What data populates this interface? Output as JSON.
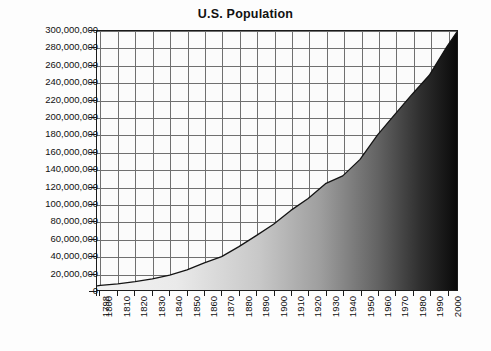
{
  "chart_data": {
    "type": "area",
    "title": "U.S. Population",
    "xlabel": "",
    "ylabel": "",
    "xlim": [
      1798,
      2006
    ],
    "ylim": [
      0,
      300000000
    ],
    "grid": true,
    "legend": null,
    "y_ticks": [
      {
        "value": 300000000,
        "label": "300,000,000"
      },
      {
        "value": 280000000,
        "label": "280,000,000"
      },
      {
        "value": 260000000,
        "label": "260,000,000"
      },
      {
        "value": 240000000,
        "label": "240,000,000"
      },
      {
        "value": 220000000,
        "label": "220,000,000"
      },
      {
        "value": 200000000,
        "label": "200,000,000"
      },
      {
        "value": 180000000,
        "label": "180,000,000"
      },
      {
        "value": 160000000,
        "label": "160,000,000"
      },
      {
        "value": 140000000,
        "label": "140,000,000"
      },
      {
        "value": 120000000,
        "label": "120,000,000"
      },
      {
        "value": 100000000,
        "label": "100,000,000"
      },
      {
        "value": 80000000,
        "label": "80,000,000"
      },
      {
        "value": 60000000,
        "label": "60,000,000"
      },
      {
        "value": 40000000,
        "label": "40,000,000"
      },
      {
        "value": 20000000,
        "label": "20,000,000"
      },
      {
        "value": 0,
        "label": "0"
      }
    ],
    "x_ticks": [
      {
        "value": 1798,
        "label": "1798"
      },
      {
        "value": 1800,
        "label": "1800"
      },
      {
        "value": 1810,
        "label": "1810"
      },
      {
        "value": 1820,
        "label": "1820"
      },
      {
        "value": 1830,
        "label": "1830"
      },
      {
        "value": 1840,
        "label": "1840"
      },
      {
        "value": 1850,
        "label": "1850"
      },
      {
        "value": 1860,
        "label": "1860"
      },
      {
        "value": 1870,
        "label": "1870"
      },
      {
        "value": 1880,
        "label": "1880"
      },
      {
        "value": 1890,
        "label": "1890"
      },
      {
        "value": 1900,
        "label": "1900"
      },
      {
        "value": 1910,
        "label": "1910"
      },
      {
        "value": 1920,
        "label": "1920"
      },
      {
        "value": 1930,
        "label": "1930"
      },
      {
        "value": 1940,
        "label": "1940"
      },
      {
        "value": 1950,
        "label": "1950"
      },
      {
        "value": 1960,
        "label": "1960"
      },
      {
        "value": 1970,
        "label": "1970"
      },
      {
        "value": 1980,
        "label": "1980"
      },
      {
        "value": 1990,
        "label": "1990"
      },
      {
        "value": 2000,
        "label": "2000"
      }
    ],
    "categories": [
      1798,
      1800,
      1810,
      1820,
      1830,
      1840,
      1850,
      1860,
      1870,
      1880,
      1890,
      1900,
      1910,
      1920,
      1930,
      1940,
      1950,
      1960,
      1970,
      1980,
      1990,
      2000,
      2006
    ],
    "values": [
      4700000,
      5300000,
      7200000,
      9600000,
      12900000,
      17100000,
      23200000,
      31400000,
      38600000,
      50200000,
      63000000,
      76200000,
      92200000,
      106000000,
      123200000,
      132200000,
      151300000,
      179300000,
      203200000,
      226500000,
      248700000,
      281400000,
      299000000
    ],
    "series": [
      {
        "name": "U.S. Population",
        "values": [
          4700000,
          5300000,
          7200000,
          9600000,
          12900000,
          17100000,
          23200000,
          31400000,
          38600000,
          50200000,
          63000000,
          76200000,
          92200000,
          106000000,
          123200000,
          132200000,
          151300000,
          179300000,
          203200000,
          226500000,
          248700000,
          281400000,
          299000000
        ]
      }
    ],
    "fill": {
      "style": "horizontal-gradient",
      "from_color": "#f2f2f2",
      "to_color": "#0a0a0a"
    },
    "line_color": "#141414",
    "grid_color": "#6f6f6f",
    "axis_color": "#1a1a1a",
    "plot_background": "#fbfbfb",
    "page_background": "#fdfdfd"
  }
}
